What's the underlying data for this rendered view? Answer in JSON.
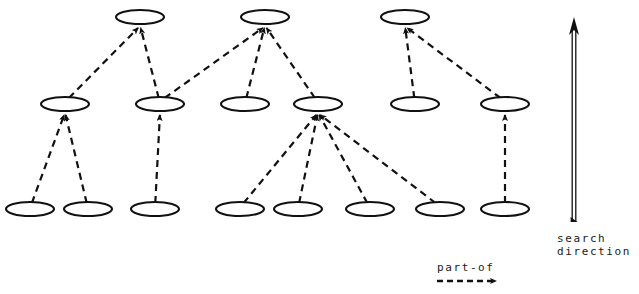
{
  "diagram": {
    "type": "part-of hierarchy graph",
    "node_shape": "ellipse",
    "edge_style": "dashed-arrow",
    "colors": {
      "stroke": "#111111",
      "background": "#ffffff"
    },
    "ellipse": {
      "rx": 24,
      "ry": 7
    },
    "rows": {
      "top_y": 17,
      "middle_y": 104,
      "bottom_y": 209
    },
    "nodes": [
      {
        "id": "t1",
        "row": "top",
        "cx": 140,
        "cy": 17
      },
      {
        "id": "t2",
        "row": "top",
        "cx": 265,
        "cy": 17
      },
      {
        "id": "t3",
        "row": "top",
        "cx": 405,
        "cy": 17
      },
      {
        "id": "m1",
        "row": "middle",
        "cx": 65,
        "cy": 104
      },
      {
        "id": "m2",
        "row": "middle",
        "cx": 160,
        "cy": 104
      },
      {
        "id": "m3",
        "row": "middle",
        "cx": 245,
        "cy": 104
      },
      {
        "id": "m4",
        "row": "middle",
        "cx": 318,
        "cy": 104
      },
      {
        "id": "m5",
        "row": "middle",
        "cx": 415,
        "cy": 104
      },
      {
        "id": "m6",
        "row": "middle",
        "cx": 505,
        "cy": 104
      },
      {
        "id": "b1",
        "row": "bottom",
        "cx": 30,
        "cy": 209
      },
      {
        "id": "b2",
        "row": "bottom",
        "cx": 88,
        "cy": 209
      },
      {
        "id": "b3",
        "row": "bottom",
        "cx": 155,
        "cy": 209
      },
      {
        "id": "b4",
        "row": "bottom",
        "cx": 240,
        "cy": 209
      },
      {
        "id": "b5",
        "row": "bottom",
        "cx": 298,
        "cy": 209
      },
      {
        "id": "b6",
        "row": "bottom",
        "cx": 370,
        "cy": 209
      },
      {
        "id": "b7",
        "row": "bottom",
        "cx": 440,
        "cy": 209
      },
      {
        "id": "b8",
        "row": "bottom",
        "cx": 505,
        "cy": 209
      }
    ],
    "edges": [
      {
        "from": "m1",
        "to": "t1"
      },
      {
        "from": "m2",
        "to": "t1"
      },
      {
        "from": "m2",
        "to": "t2"
      },
      {
        "from": "m3",
        "to": "t2"
      },
      {
        "from": "m4",
        "to": "t2"
      },
      {
        "from": "m5",
        "to": "t3"
      },
      {
        "from": "m6",
        "to": "t3"
      },
      {
        "from": "b1",
        "to": "m1"
      },
      {
        "from": "b2",
        "to": "m1"
      },
      {
        "from": "b3",
        "to": "m2"
      },
      {
        "from": "b4",
        "to": "m4"
      },
      {
        "from": "b5",
        "to": "m4"
      },
      {
        "from": "b6",
        "to": "m4"
      },
      {
        "from": "b7",
        "to": "m4"
      },
      {
        "from": "b8",
        "to": "m6"
      }
    ]
  },
  "legend": {
    "part_of": {
      "label": "part-of",
      "icon": "dashed-arrow-right",
      "arrow": {
        "x1": 437,
        "y1": 281,
        "x2": 496,
        "y2": 281
      }
    },
    "search_direction": {
      "label": "search\ndirection",
      "icon": "outlined-arrow-up",
      "arrow": {
        "x": 574,
        "y_top": 17,
        "y_bottom": 222
      }
    }
  }
}
